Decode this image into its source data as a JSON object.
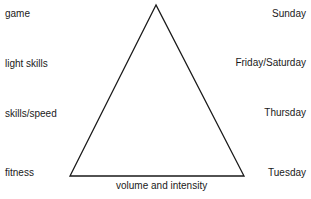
{
  "diagram": {
    "left_labels": [
      {
        "text": "game",
        "top": 8
      },
      {
        "text": "light skills",
        "top": 58
      },
      {
        "text": "skills/speed",
        "top": 108
      },
      {
        "text": "fitness",
        "top": 167
      }
    ],
    "right_labels": [
      {
        "text": "Sunday",
        "top": 8
      },
      {
        "text": "Friday/Saturday",
        "top": 57
      },
      {
        "text": "Thursday",
        "top": 107
      },
      {
        "text": "Tuesday",
        "top": 167
      }
    ],
    "base_label": "volume and intensity",
    "triangle": {
      "apex": [
        156,
        5
      ],
      "bottom_left": [
        70,
        176
      ],
      "bottom_right": [
        244,
        176
      ],
      "stroke": "#1a1a1a"
    }
  }
}
